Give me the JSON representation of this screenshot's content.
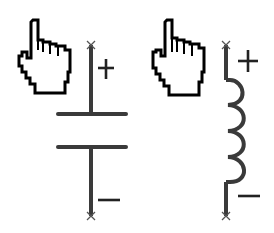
{
  "diagram": {
    "components": [
      {
        "id": "capacitor",
        "type": "capacitor",
        "pointer": "hand-pointer-icon",
        "terminals": {
          "top": "+",
          "bottom": "−"
        }
      },
      {
        "id": "inductor",
        "type": "inductor",
        "pointer": "hand-pointer-icon",
        "terminals": {
          "top": "+",
          "bottom": "−"
        }
      }
    ],
    "colors": {
      "wire": "#3a3a3a",
      "outline": "#000000",
      "background": "#ffffff"
    }
  }
}
